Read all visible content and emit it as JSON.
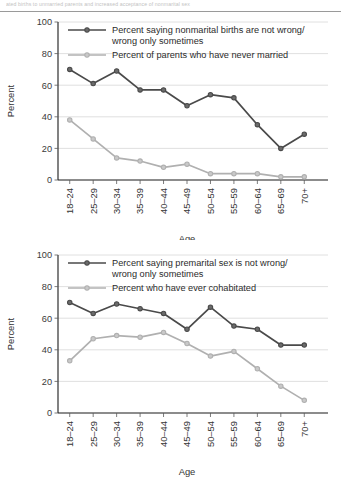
{
  "page": {
    "top_fragment": "ated births to unmarried parents and increased acceptance of nonmarital sex",
    "background_color": "#ffffff"
  },
  "colors": {
    "series_dark": "#4a4a4a",
    "series_light": "#b0b0b0",
    "axis": "#1a1a1a",
    "grid": "#d8d8d8",
    "text": "#2b2b2b"
  },
  "chart_data": [
    {
      "id": "chart-nonmarital-births",
      "type": "line",
      "title": "",
      "xlabel": "Age",
      "ylabel": "Percent",
      "ylim": [
        0,
        100
      ],
      "yticks": [
        0,
        20,
        40,
        60,
        80,
        100
      ],
      "grid": true,
      "legend_position": "top-inside",
      "categories": [
        "18–24",
        "25–29",
        "30–34",
        "35–39",
        "40–44",
        "45–49",
        "50–54",
        "55–59",
        "60–64",
        "65–69",
        "70+"
      ],
      "series": [
        {
          "name": "Percent saying nonmarital births are not wrong/ wrong only sometimes",
          "legend_line_1": "Percent saying nonmarital births are not wrong/",
          "legend_line_2": "wrong only sometimes",
          "color": "#4a4a4a",
          "values": [
            70,
            61,
            69,
            57,
            57,
            47,
            54,
            52,
            35,
            20,
            29
          ]
        },
        {
          "name": "Percent of parents who have never married",
          "legend_line_1": "Percent of parents who have never married",
          "legend_line_2": "",
          "color": "#b0b0b0",
          "values": [
            38,
            26,
            14,
            12,
            8,
            10,
            4,
            4,
            4,
            2,
            2
          ]
        }
      ]
    },
    {
      "id": "chart-premarital-sex",
      "type": "line",
      "title": "",
      "xlabel": "Age",
      "ylabel": "Percent",
      "ylim": [
        0,
        100
      ],
      "yticks": [
        0,
        20,
        40,
        60,
        80,
        100
      ],
      "grid": true,
      "legend_position": "top-inside",
      "categories": [
        "18–24",
        "25–29",
        "30–34",
        "35–39",
        "40–44",
        "45–49",
        "50–54",
        "55–59",
        "60–64",
        "65–69",
        "70+"
      ],
      "series": [
        {
          "name": "Percent saying premarital sex is not wrong/ wrong only sometimes",
          "legend_line_1": "Percent saying premarital sex is not wrong/",
          "legend_line_2": "wrong only sometimes",
          "color": "#4a4a4a",
          "values": [
            70,
            63,
            69,
            66,
            63,
            53,
            67,
            55,
            53,
            43,
            43
          ]
        },
        {
          "name": "Percent who have ever cohabitated",
          "legend_line_1": "Percent who have ever cohabitated",
          "legend_line_2": "",
          "color": "#b0b0b0",
          "values": [
            33,
            47,
            49,
            48,
            51,
            44,
            36,
            39,
            28,
            17,
            8
          ]
        }
      ]
    }
  ]
}
